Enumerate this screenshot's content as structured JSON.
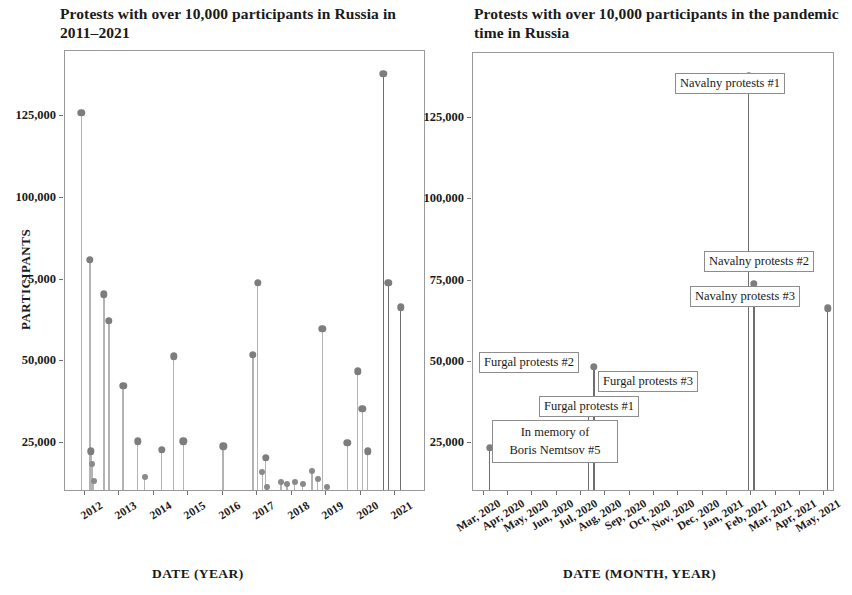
{
  "figure": {
    "panels": [
      "left",
      "right"
    ]
  },
  "left": {
    "title": "Protests with over 10,000 participants in Russia in 2011–2021",
    "ylabel": "PARTICIPANTS",
    "xlabel": "DATE (YEAR)",
    "ytick_labels": [
      "25,000",
      "50,000",
      "75,000",
      "100,000",
      "125,000"
    ],
    "xtick_labels": [
      "2012",
      "2013",
      "2014",
      "2015",
      "2016",
      "2017",
      "2018",
      "2019",
      "2020",
      "2021"
    ]
  },
  "right": {
    "title": "Protests with over 10,000 participants in the pandemic time in Russia",
    "ylabel": "",
    "xlabel": "DATE (MONTH, YEAR)",
    "ytick_labels": [
      "25,000",
      "50,000",
      "75,000",
      "100,000",
      "125,000"
    ],
    "xtick_labels": [
      "Mar, 2020",
      "Apr, 2020",
      "May, 2020",
      "Jun, 2020",
      "Jul, 2020",
      "Aug, 2020",
      "Sep, 2020",
      "Oct, 2020",
      "Nov, 2020",
      "Dec, 2020",
      "Jan, 2021",
      "Feb, 2021",
      "Mar, 2021",
      "Apr, 2021",
      "May, 2021"
    ],
    "annotations": [
      {
        "id": "navalny-1",
        "text": "Navalny protests #1"
      },
      {
        "id": "navalny-2",
        "text": "Navalny protests #2"
      },
      {
        "id": "navalny-3",
        "text": "Navalny protests #3"
      },
      {
        "id": "furgal-2",
        "text": "Furgal protests #2"
      },
      {
        "id": "furgal-3",
        "text": "Furgal protests #3"
      },
      {
        "id": "furgal-1",
        "text": "Furgal protests #1"
      },
      {
        "id": "nemtsov-5-line1",
        "text": "In memory of"
      },
      {
        "id": "nemtsov-5-line2",
        "text": "Boris Nemtsov #5"
      }
    ]
  },
  "colors": {
    "dot": "#7d7d7d",
    "stem": "#b3b3b3",
    "stem_dark": "#6e6e6e",
    "frame": "#9a9a9a",
    "text": "#1a1a1a",
    "background": "#ffffff"
  },
  "chart_data": [
    {
      "type": "scatter",
      "panel": "left",
      "title": "Protests with over 10,000 participants in Russia in 2011–2021",
      "xlabel": "DATE (YEAR)",
      "ylabel": "PARTICIPANTS",
      "xlim": [
        "2011-09",
        "2021-09"
      ],
      "ylim": [
        10000,
        145000
      ],
      "yticks": [
        25000,
        50000,
        75000,
        100000,
        125000
      ],
      "ytick_labels": [
        "25,000",
        "50,000",
        "75,000",
        "100,000",
        "125,000"
      ],
      "xticks": [
        2012,
        2013,
        2014,
        2015,
        2016,
        2017,
        2018,
        2019,
        2020,
        2021
      ],
      "grid": false,
      "legend": "none",
      "marker": "lollipop (stem to bottom + circle)",
      "points": [
        {
          "x": "2011-12",
          "x_frac": 0.045,
          "y": 126000
        },
        {
          "x": "2012-02",
          "x_frac": 0.069,
          "y": 81000
        },
        {
          "x": "2012-03",
          "x_frac": 0.072,
          "y": 22500
        },
        {
          "x": "2012-05",
          "x_frac": 0.076,
          "y": 18500
        },
        {
          "x": "2012-06",
          "x_frac": 0.079,
          "y": 13500
        },
        {
          "x": "2012-09",
          "x_frac": 0.108,
          "y": 70500
        },
        {
          "x": "2012-12",
          "x_frac": 0.122,
          "y": 62500
        },
        {
          "x": "2013-06",
          "x_frac": 0.161,
          "y": 42500
        },
        {
          "x": "2013-10",
          "x_frac": 0.201,
          "y": 25500
        },
        {
          "x": "2013-12",
          "x_frac": 0.221,
          "y": 14500
        },
        {
          "x": "2014-09",
          "x_frac": 0.268,
          "y": 23000
        },
        {
          "x": "2015-06",
          "x_frac": 0.328,
          "y": 25500
        },
        {
          "x": "2015-12",
          "x_frac": 0.301,
          "y": 51500
        },
        {
          "x": "2016-06",
          "x_frac": 0.438,
          "y": 24000
        },
        {
          "x": "2017-02",
          "x_frac": 0.521,
          "y": 52000
        },
        {
          "x": "2017-03",
          "x_frac": 0.534,
          "y": 74000
        },
        {
          "x": "2017-06",
          "x_frac": 0.547,
          "y": 16000
        },
        {
          "x": "2017-09",
          "x_frac": 0.556,
          "y": 20500
        },
        {
          "x": "2017-12",
          "x_frac": 0.56,
          "y": 11500
        },
        {
          "x": "2018-03",
          "x_frac": 0.598,
          "y": 13000
        },
        {
          "x": "2018-05",
          "x_frac": 0.615,
          "y": 12500
        },
        {
          "x": "2018-09",
          "x_frac": 0.636,
          "y": 13000
        },
        {
          "x": "2018-12",
          "x_frac": 0.658,
          "y": 12500
        },
        {
          "x": "2019-03",
          "x_frac": 0.684,
          "y": 16500
        },
        {
          "x": "2019-07",
          "x_frac": 0.7,
          "y": 14000
        },
        {
          "x": "2019-08",
          "x_frac": 0.713,
          "y": 60000
        },
        {
          "x": "2019-09",
          "x_frac": 0.727,
          "y": 11500
        },
        {
          "x": "2020-02",
          "x_frac": 0.782,
          "y": 25000
        },
        {
          "x": "2020-07",
          "x_frac": 0.811,
          "y": 47000
        },
        {
          "x": "2020-09",
          "x_frac": 0.824,
          "y": 35500
        },
        {
          "x": "2020-12",
          "x_frac": 0.838,
          "y": 22500
        },
        {
          "x": "2021-01",
          "x_frac": 0.882,
          "y": 138000
        },
        {
          "x": "2021-02",
          "x_frac": 0.896,
          "y": 74000
        },
        {
          "x": "2021-04",
          "x_frac": 0.93,
          "y": 66500
        }
      ]
    },
    {
      "type": "scatter",
      "panel": "right",
      "title": "Protests with over 10,000 participants in the pandemic time in Russia",
      "xlabel": "DATE (MONTH, YEAR)",
      "ylabel": "",
      "xlim": [
        "2020-03",
        "2021-05"
      ],
      "ylim": [
        10000,
        145000
      ],
      "yticks": [
        25000,
        50000,
        75000,
        100000,
        125000
      ],
      "ytick_labels": [
        "25,000",
        "50,000",
        "75,000",
        "100,000",
        "125,000"
      ],
      "xticks": [
        "Mar, 2020",
        "Apr, 2020",
        "May, 2020",
        "Jun, 2020",
        "Jul, 2020",
        "Aug, 2020",
        "Sep, 2020",
        "Oct, 2020",
        "Nov, 2020",
        "Dec, 2020",
        "Jan, 2021",
        "Feb, 2021",
        "Mar, 2021",
        "Apr, 2021",
        "May, 2021"
      ],
      "grid": false,
      "legend": "none",
      "marker": "lollipop (stem to bottom + circle)",
      "points": [
        {
          "label": "In memory of Boris Nemtsov #5",
          "x": "Mar, 2020",
          "x_frac": 0.046,
          "y": 23500
        },
        {
          "label": "Furgal protests #2",
          "x": "Jul, 2020",
          "x_frac": 0.334,
          "y": 48500
        },
        {
          "label": "Furgal protests #3",
          "x": "Jul, 2020",
          "x_frac": 0.334,
          "y": 38000
        },
        {
          "label": "Furgal protests #1",
          "x": "Jul, 2020",
          "x_frac": 0.32,
          "y": 34000
        },
        {
          "label": "Navalny protests #1",
          "x": "Jan, 2021",
          "x_frac": 0.762,
          "y": 138000
        },
        {
          "label": "Navalny protests #2",
          "x": "Jan, 2021",
          "x_frac": 0.776,
          "y": 74000
        },
        {
          "label": "Navalny protests #3",
          "x": "Apr, 2021",
          "x_frac": 0.98,
          "y": 66500
        }
      ]
    }
  ]
}
